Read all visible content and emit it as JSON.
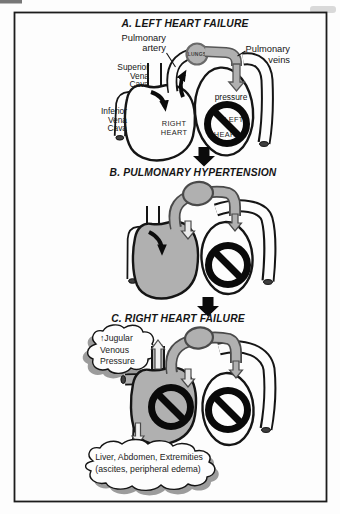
{
  "figure": {
    "type": "medical-diagram"
  },
  "colors": {
    "diagram_gray": "#b0b0b0",
    "tube_outline_gray": "#565656",
    "ink_black": "#111111",
    "shadow_gray": "#9c9c9c",
    "open_end_dark": "#3f3f3f"
  },
  "panel_a": {
    "title": "A.  LEFT HEART FAILURE",
    "labels": {
      "pulmonary_artery_line1": "Pulmonary",
      "pulmonary_artery_line2": "artery",
      "pulmonary_veins_line1": "Pulmonary",
      "pulmonary_veins_line2": "veins",
      "superior_vena_cava_line1": "Superior",
      "superior_vena_cava_line2": "Vena",
      "superior_vena_cava_line3": "Cava",
      "inferior_vena_cava_line1": "Inferior",
      "inferior_vena_cava_line2": "Vena",
      "inferior_vena_cava_line3": "Cava",
      "lungs": "LUNGS",
      "pressure": "pressure",
      "right_heart_line1": "RIGHT",
      "right_heart_line2": "HEART",
      "left_heart_line1": "LEFT",
      "left_heart_line2": "HEART"
    }
  },
  "panel_b": {
    "title": "B. PULMONARY HYPERTENSION"
  },
  "panel_c": {
    "title": "C. RIGHT HEART FAILURE",
    "jugular_cloud": {
      "line1": "↑Jugular",
      "line2": "Venous",
      "line3": "Pressure"
    },
    "systemic_cloud": {
      "line1": "Liver, Abdomen, Extremities",
      "line2": "(ascites, peripheral edema)"
    }
  }
}
